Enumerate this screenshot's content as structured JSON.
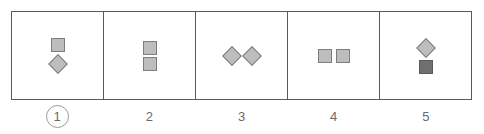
{
  "answer_row": {
    "name": "answer-options-row",
    "selected_option": "1",
    "colors": {
      "frame_stroke": "#5a5a5a",
      "shape_fill_light": "#bdbdbd",
      "shape_fill_dark": "#6f6f6f",
      "shape_stroke": "#7d7d7d",
      "label_text": "#6b6b6b",
      "selection_ring": "#9a9a9a",
      "background": "#ffffff"
    },
    "options": [
      {
        "label": "1",
        "selected": true,
        "arrangement": "vertical",
        "shapes": [
          {
            "type": "square",
            "shade": "light"
          },
          {
            "type": "diamond",
            "shade": "light"
          }
        ]
      },
      {
        "label": "2",
        "selected": false,
        "arrangement": "vertical",
        "shapes": [
          {
            "type": "square",
            "shade": "light"
          },
          {
            "type": "square",
            "shade": "light"
          }
        ]
      },
      {
        "label": "3",
        "selected": false,
        "arrangement": "horizontal",
        "shapes": [
          {
            "type": "diamond",
            "shade": "light"
          },
          {
            "type": "diamond",
            "shade": "light"
          }
        ]
      },
      {
        "label": "4",
        "selected": false,
        "arrangement": "horizontal",
        "shapes": [
          {
            "type": "square",
            "shade": "light"
          },
          {
            "type": "square",
            "shade": "light"
          }
        ]
      },
      {
        "label": "5",
        "selected": false,
        "arrangement": "vertical",
        "shapes": [
          {
            "type": "diamond",
            "shade": "light"
          },
          {
            "type": "square",
            "shade": "dark"
          }
        ]
      }
    ]
  }
}
